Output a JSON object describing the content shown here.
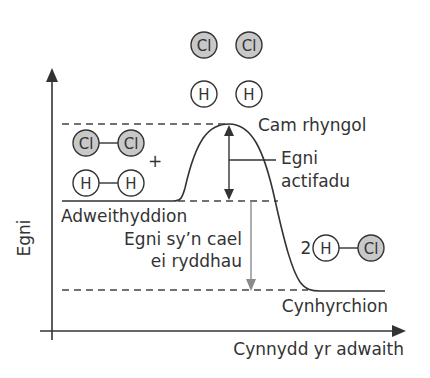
{
  "diagram": {
    "type": "energy-profile",
    "axes": {
      "y_label": "Egni",
      "x_label": "Cynnydd yr adwaith"
    },
    "labels": {
      "transition_state": "Cam rhyngol",
      "activation_energy_line1": "Egni",
      "activation_energy_line2": "actifadu",
      "reactants": "Adweithyddion",
      "energy_released_line1": "Egni sy’n cael",
      "energy_released_line2": "ei ryddhau",
      "products": "Cynhyrchion",
      "plus": "+",
      "coefficient": "2"
    },
    "atoms": {
      "chlorine": "Cl",
      "hydrogen": "H"
    },
    "colors": {
      "line": "#333333",
      "chlorine_fill": "#c8c8c8",
      "hydrogen_fill": "#ffffff",
      "released_arrow": "#8a8a8a",
      "dashed": "#444444"
    }
  }
}
